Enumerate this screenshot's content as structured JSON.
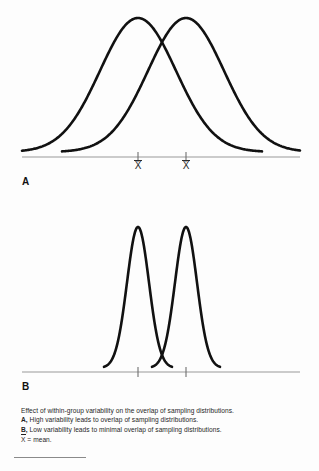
{
  "figure": {
    "background_color": "#fdfdfd",
    "curve_color": "#111111",
    "axis_color": "#9a9a9a",
    "panels": [
      {
        "id": "A",
        "letter": "A",
        "description": "High variability leads to overlap of sampling distributions",
        "mean_label_1": "X",
        "mean_label_2": "X"
      },
      {
        "id": "B",
        "letter": "B",
        "description": "Low variability leads to minimal overlap of sampling distributions",
        "mean_label_1": "X",
        "mean_label_2": "X"
      }
    ]
  },
  "caption": {
    "line1": "Effect of within-group variability on the overlap of sampling distributions.",
    "line2_label": "A,",
    "line2_text": "High variability leads to overlap of sampling distributions.",
    "line3_label": "B,",
    "line3_text": "Low variability leads to minimal overlap of sampling distributions.",
    "line4_symbol": "X",
    "line4_text": "= mean."
  },
  "chart_data": {
    "type": "line",
    "title": "Effect of within-group variability on the overlap of sampling distributions",
    "xlabel": "",
    "ylabel": "",
    "grid": false,
    "legend_position": "none",
    "panels": [
      {
        "panel": "A",
        "label": "High variability leads to overlap of sampling distributions",
        "axis_x_range": [
          22,
          300
        ],
        "axis_y": 157,
        "ticks": [
          {
            "x": 138,
            "label": "X"
          },
          {
            "x": 186,
            "label": "X"
          }
        ],
        "series": [
          {
            "name": "distribution-1",
            "distribution": "normal",
            "mean": 138,
            "sigma": 38,
            "peak_y": 18,
            "baseline_y": 152,
            "x_start": 22,
            "x_end": 262
          },
          {
            "name": "distribution-2",
            "distribution": "normal",
            "mean": 186,
            "sigma": 38,
            "peak_y": 18,
            "baseline_y": 152,
            "x_start": 62,
            "x_end": 300
          }
        ]
      },
      {
        "panel": "B",
        "label": "Low variability leads to minimal overlap of sampling distributions",
        "axis_x_range": [
          22,
          300
        ],
        "axis_y": 372,
        "ticks": [
          {
            "x": 138,
            "label": "X"
          },
          {
            "x": 186,
            "label": "X"
          }
        ],
        "series": [
          {
            "name": "distribution-1",
            "distribution": "normal",
            "mean": 138,
            "sigma": 11,
            "peak_y": 227,
            "baseline_y": 368,
            "x_start": 104,
            "x_end": 172
          },
          {
            "name": "distribution-2",
            "distribution": "normal",
            "mean": 186,
            "sigma": 11,
            "peak_y": 227,
            "baseline_y": 368,
            "x_start": 152,
            "x_end": 220
          }
        ]
      }
    ]
  }
}
